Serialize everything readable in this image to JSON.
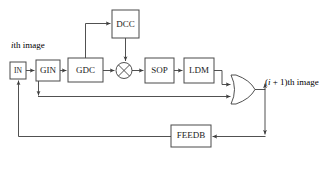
{
  "diagram": {
    "stroke_color": "#3d3d3d",
    "box_stroke_color": "#4a4a4a",
    "background_color": "#ffffff",
    "text_color": "#1a1a1a"
  },
  "blocks": {
    "in": {
      "label": "IN",
      "x": 10,
      "y": 62,
      "w": 16,
      "h": 17
    },
    "gin": {
      "label": "GIN",
      "x": 36,
      "y": 60,
      "w": 24,
      "h": 21
    },
    "gdc": {
      "label": "GDC",
      "x": 68,
      "y": 58,
      "w": 35,
      "h": 24
    },
    "dcc": {
      "label": "DCC",
      "x": 112,
      "y": 10,
      "w": 27,
      "h": 28
    },
    "sop": {
      "label": "SOP",
      "x": 145,
      "y": 58,
      "w": 29,
      "h": 25
    },
    "ldm": {
      "label": "LDM",
      "x": 184,
      "y": 58,
      "w": 30,
      "h": 25
    },
    "feedb": {
      "label": "FEEDB",
      "x": 171,
      "y": 125,
      "w": 40,
      "h": 22
    }
  },
  "symbols": {
    "multiplier": {
      "name": "circle-cross-multiplier",
      "cx": 124,
      "cy": 70,
      "r": 8
    },
    "merge": {
      "name": "merge-junction",
      "x": 231,
      "y": 75,
      "w": 24,
      "h": 29
    }
  },
  "labels": {
    "input_image": {
      "italic": "i",
      "rest": "th image"
    },
    "output_image": {
      "prefix": "(",
      "italic": "i",
      "rest": " + 1)th image"
    }
  },
  "connections": [
    {
      "name": "in-to-gin",
      "from": "IN",
      "to": "GIN"
    },
    {
      "name": "gin-to-gdc",
      "from": "GIN",
      "to": "GDC"
    },
    {
      "name": "gin-branch-to-merge",
      "from": "GIN",
      "to": "merge-junction"
    },
    {
      "name": "gdc-to-dcc",
      "from": "GDC",
      "to": "DCC"
    },
    {
      "name": "gdc-to-multiplier",
      "from": "GDC",
      "to": "multiplier"
    },
    {
      "name": "dcc-to-multiplier",
      "from": "DCC",
      "to": "multiplier"
    },
    {
      "name": "multiplier-to-sop",
      "from": "multiplier",
      "to": "SOP"
    },
    {
      "name": "sop-to-ldm",
      "from": "SOP",
      "to": "LDM"
    },
    {
      "name": "ldm-to-merge",
      "from": "LDM",
      "to": "merge-junction"
    },
    {
      "name": "merge-to-output",
      "from": "merge-junction",
      "to": "output"
    },
    {
      "name": "output-to-feedb",
      "from": "output",
      "to": "FEEDB"
    },
    {
      "name": "feedb-to-in",
      "from": "FEEDB",
      "to": "IN"
    }
  ]
}
